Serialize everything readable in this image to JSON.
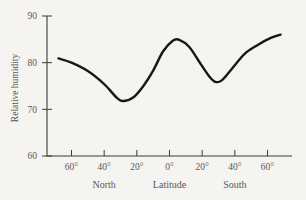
{
  "chart_data": {
    "type": "line",
    "title": "",
    "subtitle": "",
    "xlabel": "Latitude",
    "ylabel": "Relative humidity",
    "grid": false,
    "legend": null,
    "ylim": [
      60,
      90
    ],
    "yticks": [
      60,
      70,
      80,
      90
    ],
    "ytick_labels": [
      "60",
      "70",
      "80",
      "90"
    ],
    "xlim": [
      -75,
      75
    ],
    "xticks": [
      -60,
      -40,
      -20,
      0,
      20,
      40,
      60
    ],
    "xtick_labels": [
      "60°",
      "40°",
      "20°",
      "0°",
      "20°",
      "40°",
      "60°"
    ],
    "x_region_labels": [
      {
        "text": "North",
        "at_x": -40
      },
      {
        "text": "Latitude",
        "at_x": 0
      },
      {
        "text": "South",
        "at_x": 40
      }
    ],
    "series": [
      {
        "name": "Relative humidity",
        "color": "#17171a",
        "x": [
          -68,
          -60,
          -50,
          -40,
          -32,
          -28,
          -22,
          -16,
          -10,
          -4,
          2,
          6,
          12,
          18,
          24,
          28,
          32,
          38,
          46,
          54,
          62,
          68
        ],
        "values": [
          80.9,
          80.0,
          78.2,
          75.4,
          72.4,
          71.8,
          72.6,
          75.0,
          78.3,
          82.4,
          84.7,
          84.9,
          83.4,
          80.3,
          77.2,
          75.9,
          76.2,
          78.6,
          81.9,
          83.8,
          85.3,
          86.0
        ]
      }
    ],
    "annotations": {
      "northern_minimum": 71.8,
      "equatorial_maximum": 84.9,
      "southern_minimum": 75.9,
      "right_endpoint": 86.0,
      "left_endpoint": 80.9
    }
  },
  "axis": {
    "y_label": "Relative humidity",
    "x_center_label": "Latitude",
    "x_left_label": "North",
    "x_right_label": "South"
  },
  "colors": {
    "background": "#f6f4f0",
    "axis": "#3b3b3b",
    "curve": "#17171a",
    "text": "#58585a"
  }
}
